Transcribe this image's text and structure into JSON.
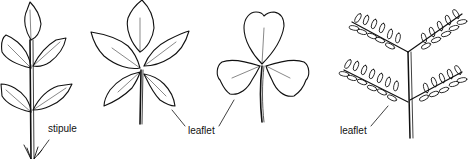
{
  "diagram": {
    "figures": [
      {
        "id": "pinnate-serrated",
        "description": "pinnate leaf with serrated leaflets and stipules"
      },
      {
        "id": "palmate",
        "description": "palmately compound leaf with five leaflets"
      },
      {
        "id": "trifoliate",
        "description": "trifoliate clover-like leaf"
      },
      {
        "id": "bipinnate",
        "description": "bipinnate leaf with many small leaflets"
      }
    ],
    "labels": {
      "stipule": "stipule",
      "leaflet_palmate": "leaflet",
      "leaflet_bipinnate": "leaflet"
    },
    "colors": {
      "stroke": "#111111",
      "background": "#ffffff"
    }
  }
}
